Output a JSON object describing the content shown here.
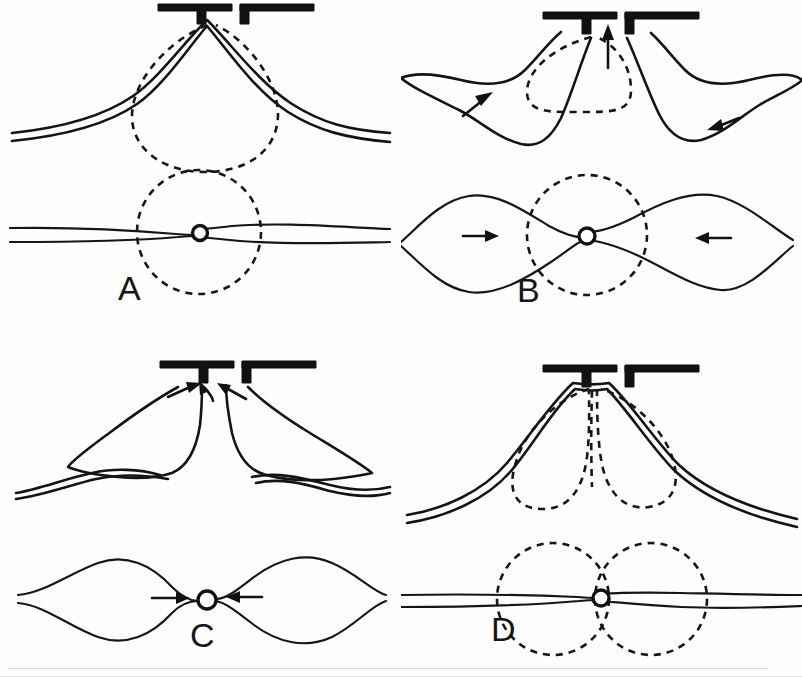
{
  "figure": {
    "background_color": "#fefefe",
    "ink_color": "#141414",
    "panel_count": 4,
    "layout": "2x2 grid"
  },
  "panels": [
    {
      "id": "A",
      "label": "A",
      "position": "top-left",
      "arrow_count": 0,
      "dashed_shape_count": 2,
      "views": [
        {
          "name": "side-view",
          "description": "Double membrane line tented upward into a narrow slit aperture; dashed teardrop outline beneath the tent"
        },
        {
          "name": "plan-view",
          "description": "Flat double line pinched through a small open ring at center; dashed circle around the ring"
        }
      ]
    },
    {
      "id": "B",
      "label": "B",
      "position": "top-right",
      "arrow_count": 3,
      "dashed_shape_count": 2,
      "views": [
        {
          "name": "side-view",
          "description": "Tented double membrane with two lateral lobes; vertical arrow points up into the slit; diagonal arrows inside each lobe point toward center"
        },
        {
          "name": "plan-view",
          "description": "Pinched ring with two symmetric lobes; horizontal arrows point inward; dashed circle at the ring"
        }
      ]
    },
    {
      "id": "C",
      "label": "C",
      "position": "bottom-left",
      "arrow_count": 5,
      "dashed_shape_count": 0,
      "views": [
        {
          "name": "side-view",
          "description": "Two tall lobes fully converged at the slit, no dashed outline; three converging arrows at the apex"
        },
        {
          "name": "plan-view",
          "description": "Two lens-shaped lobes meeting at the central ring; horizontal arrows point inward at the ring"
        }
      ]
    },
    {
      "id": "D",
      "label": "D",
      "position": "bottom-right",
      "arrow_count": 0,
      "dashed_shape_count": 3,
      "views": [
        {
          "name": "side-view",
          "description": "Tented double membrane with two dashed lobes divided by a dashed median septum"
        },
        {
          "name": "plan-view",
          "description": "Flat double line through the central ring with two dashed circles side by side, touching at the ring"
        }
      ]
    }
  ],
  "legend_elements": {
    "solid_line": "cell membrane / outline (solid)",
    "dashed_line": "internal vesicle or compartment boundary (dashed)",
    "ring": "pore / constriction ring (open circle)",
    "bracket": "pipette tip or slit aperture (solid black)",
    "arrow": "direction of flow or movement"
  }
}
